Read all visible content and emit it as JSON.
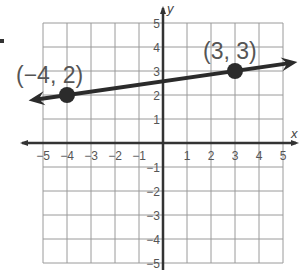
{
  "chart_data": {
    "type": "line",
    "title": "",
    "xlabel": "x",
    "ylabel": "y",
    "xlim": [
      -5,
      5
    ],
    "ylim": [
      -5,
      5
    ],
    "grid": true,
    "x_ticks": [
      "−5",
      "−4",
      "−3",
      "−2",
      "−1",
      "1",
      "2",
      "3",
      "4",
      "5"
    ],
    "y_ticks": [
      "5",
      "4",
      "3",
      "2",
      "1",
      "−1",
      "−2",
      "−3",
      "−4",
      "−5"
    ],
    "series": [
      {
        "name": "line",
        "style": "line with arrows both ends",
        "points": [
          {
            "x": -4,
            "y": 2,
            "label": "(−4, 2)"
          },
          {
            "x": 3,
            "y": 3,
            "label": "(3, 3)"
          }
        ]
      }
    ],
    "colors": {
      "grid": "#9a9a9a",
      "axis": "#333333",
      "line": "#2b2b2b",
      "point": "#2b2b2b",
      "text": "#555555"
    }
  }
}
